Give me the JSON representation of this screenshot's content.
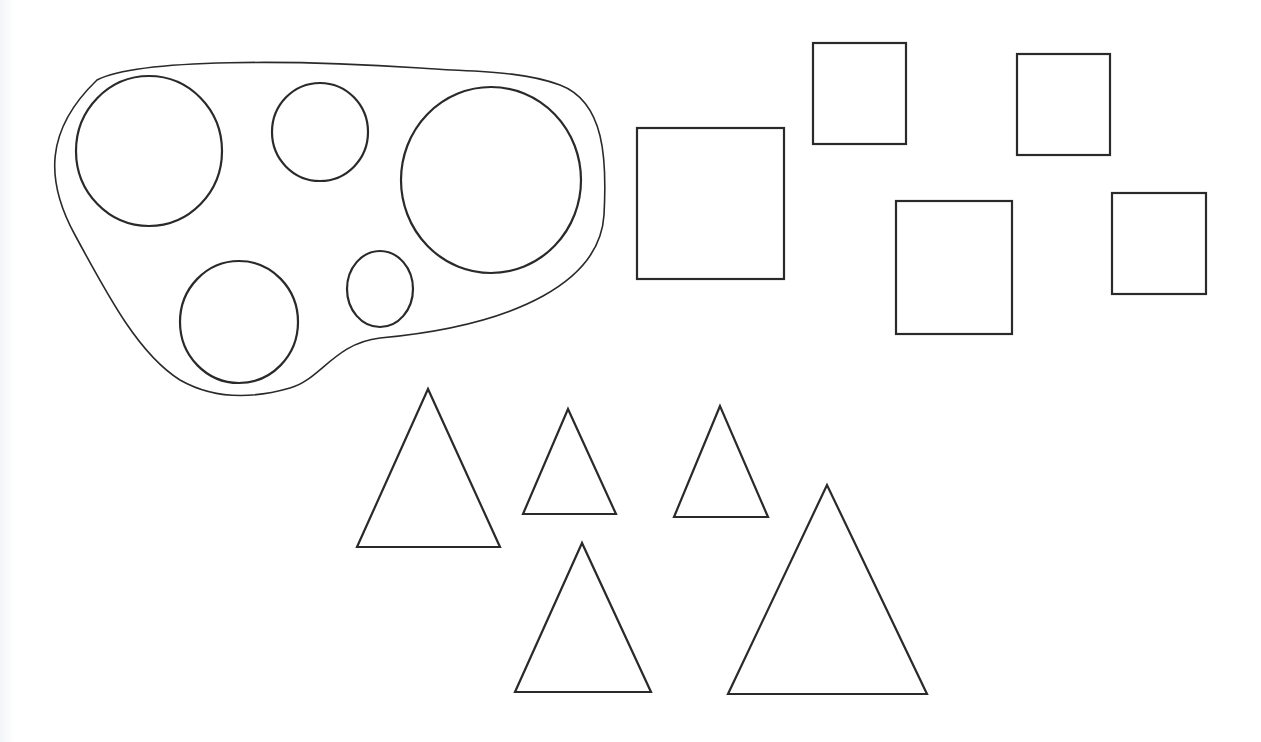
{
  "diagram": {
    "stroke_color": "#2a2a2a",
    "background": "#ffffff",
    "groups": [
      {
        "name": "circles",
        "enclosed": true,
        "count": 5,
        "shapes": [
          {
            "cx": 149,
            "cy": 151,
            "rx": 73,
            "ry": 75
          },
          {
            "cx": 320,
            "cy": 132,
            "rx": 48,
            "ry": 49
          },
          {
            "cx": 491,
            "cy": 180,
            "rx": 90,
            "ry": 93
          },
          {
            "cx": 239,
            "cy": 322,
            "rx": 59,
            "ry": 61
          },
          {
            "cx": 380,
            "cy": 289,
            "rx": 33,
            "ry": 38
          }
        ]
      },
      {
        "name": "rectangles",
        "enclosed": false,
        "count": 5,
        "shapes": [
          {
            "x": 637,
            "y": 128,
            "w": 147,
            "h": 151
          },
          {
            "x": 813,
            "y": 43,
            "w": 93,
            "h": 101
          },
          {
            "x": 1017,
            "y": 54,
            "w": 93,
            "h": 101
          },
          {
            "x": 896,
            "y": 201,
            "w": 116,
            "h": 133
          },
          {
            "x": 1112,
            "y": 193,
            "w": 94,
            "h": 101
          }
        ]
      },
      {
        "name": "triangles",
        "enclosed": false,
        "count": 5,
        "shapes": [
          {
            "points": "428,389 357,547 500,547"
          },
          {
            "points": "568,409 523,514 616,514"
          },
          {
            "points": "720,406 674,517 768,517"
          },
          {
            "points": "582,543 515,692 651,692"
          },
          {
            "points": "827,485 728,694 927,694"
          }
        ]
      }
    ]
  }
}
